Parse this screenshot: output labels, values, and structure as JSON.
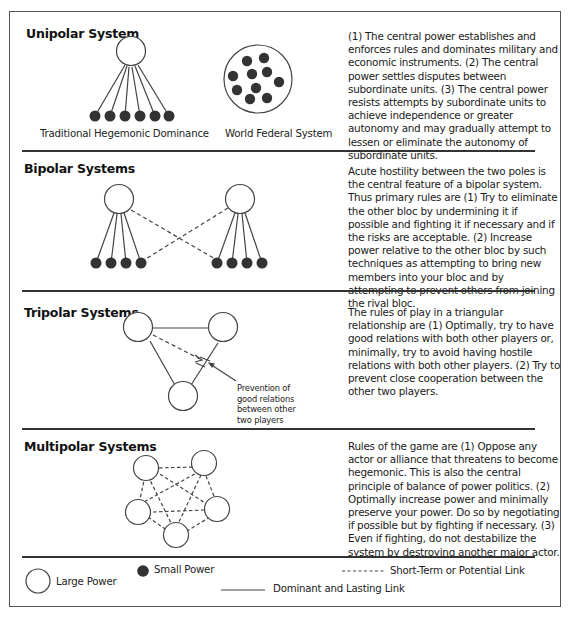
{
  "sections": [
    {
      "title": "Unipolar System",
      "description": "(1) The central power establishes and enforces rules and dominates military and economic instruments. (2) The central power settles disputes between subordinate units. (3) The central power resists attempts by subordinate units to achieve independence or greater autonomy and may gradually attempt to lessen or eliminate the autonomy of subordinate units.",
      "captions": [
        "Traditional Hegemonic Dominance",
        "World Federal System"
      ]
    },
    {
      "title": "Bipolar Systems",
      "description": "Acute hostility between the two poles is the central feature of a bipolar system. Thus primary rules are (1) Try to eliminate the other bloc by undermining it if possible and fighting it if necessary and if the risks are acceptable. (2) Increase power relative to the other bloc by such techniques as attempting to bring new members into your bloc and by attempting to prevent others from joining the rival bloc."
    },
    {
      "title": "Tripolar Systems",
      "description": "The rules of play in a triangular relationship are (1) Optimally, try to have good relations with both other players or, minimally, try to avoid having hostile relations with both other players. (2) Try to prevent close cooperation between the other two players.",
      "annotation": [
        "Prevention of",
        "good relations",
        "between other",
        "two players"
      ]
    },
    {
      "title": "Multipolar Systems",
      "description": "Rules of the game are (1) Oppose any actor or alliance that threatens to become hegemonic. This is also the central principle of balance of power politics. (2) Optimally increase power and minimally preserve your power. Do so by negotiating if possible but by fighting if necessary. (3) Even if fighting, do not destabilize the system by destroying another major actor."
    }
  ],
  "legend": {
    "large_power": "Large Power",
    "small_power": "Small Power",
    "short_term_link": "Short-Term or Potential Link",
    "dominant_link": "Dominant and Lasting Link"
  },
  "colors": {
    "node_fill_small": "#333333",
    "node_stroke": "#444444",
    "rule": "#333333"
  }
}
